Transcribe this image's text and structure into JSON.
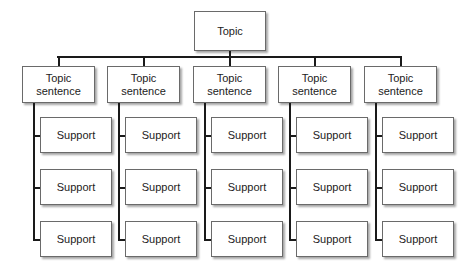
{
  "diagram": {
    "type": "hierarchy",
    "root": {
      "label": "Topic"
    },
    "columns": [
      {
        "label_line1": "Topic",
        "label_line2": "sentence",
        "supports": [
          "Support",
          "Support",
          "Support"
        ]
      },
      {
        "label_line1": "Topic",
        "label_line2": "sentence",
        "supports": [
          "Support",
          "Support",
          "Support"
        ]
      },
      {
        "label_line1": "Topic",
        "label_line2": "sentence",
        "supports": [
          "Support",
          "Support",
          "Support"
        ]
      },
      {
        "label_line1": "Topic",
        "label_line2": "sentence",
        "supports": [
          "Support",
          "Support",
          "Support"
        ]
      },
      {
        "label_line1": "Topic",
        "label_line2": "sentence",
        "supports": [
          "Support",
          "Support",
          "Support"
        ]
      }
    ]
  }
}
